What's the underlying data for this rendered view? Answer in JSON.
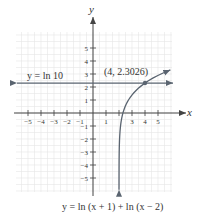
{
  "chart_data": {
    "type": "line",
    "title": "",
    "xlabel": "x",
    "ylabel": "y",
    "xlim": [
      -6,
      6
    ],
    "ylim": [
      -6,
      6
    ],
    "grid": true,
    "x_ticks": [
      -5,
      -4,
      -3,
      -2,
      -1,
      1,
      2,
      3,
      4,
      5
    ],
    "x_tick_labels": [
      "−5",
      "−4",
      "−3",
      "−2",
      "−1",
      "1",
      "",
      "3",
      "4",
      "5"
    ],
    "y_ticks": [
      1,
      2,
      3,
      4,
      5,
      -1,
      -2,
      -3,
      -4,
      -5
    ],
    "y_tick_labels": [
      "1",
      "2",
      "3",
      "4",
      "5",
      "−1",
      "−2",
      "−3",
      "−4",
      "−5"
    ],
    "series": [
      {
        "name": "y = ln (x + 1) + ln (x − 2)",
        "function": "ln(x+1)+ln(x-2)",
        "domain": [
          2,
          6
        ],
        "x": [
          2.001,
          2.01,
          2.05,
          2.1,
          2.25,
          2.5,
          3,
          3.5,
          4,
          4.5,
          5,
          5.6
        ],
        "values": [
          -5.8,
          -3.5,
          -1.9,
          -1.14,
          -0.31,
          0.56,
          1.39,
          1.96,
          2.3026,
          2.65,
          2.89,
          3.15
        ]
      },
      {
        "name": "y = ln 10",
        "function": "constant",
        "value": 2.3026
      }
    ],
    "annotations": [
      {
        "text": "(4, 2.3026)",
        "x": 4,
        "y": 2.3026,
        "type": "intersection-point"
      },
      {
        "text": "y = ln 10",
        "type": "line-label"
      },
      {
        "text": "y = ln (x + 1) + ln (x − 2)",
        "type": "curve-label"
      }
    ]
  },
  "labels": {
    "y_axis": "y",
    "x_axis": "x",
    "hline": "y = ln 10",
    "point": "(4, 2.3026)",
    "curve": "y = ln (x + 1) + ln (x − 2)"
  },
  "colors": {
    "axis": "#444444",
    "curve": "#5a6470",
    "grid": "#e6e6e6",
    "text": "#333333"
  }
}
